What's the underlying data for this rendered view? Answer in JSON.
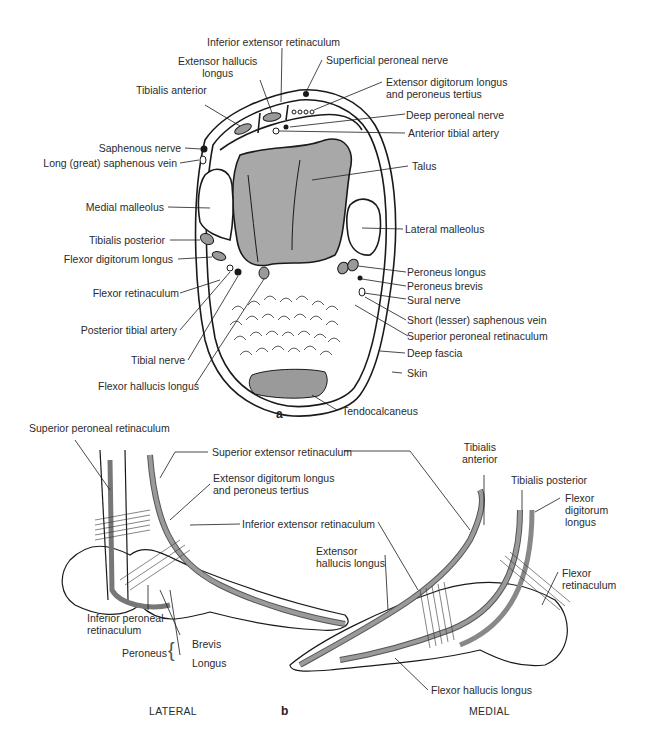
{
  "figure": {
    "panel_a_tag": "a",
    "panel_b_tag": "b",
    "colors": {
      "line": "#1a1a1a",
      "bone_fill": "#a8a8a8",
      "tendon_fill": "#9a9a9a",
      "background": "#ffffff"
    }
  },
  "panel_a": {
    "title": "Transverse section through ankle",
    "labels": {
      "inferior_extensor_retinaculum": "Inferior extensor retinaculum",
      "superficial_peroneal_nerve": "Superficial peroneal nerve",
      "extensor_hallucis_longus": "Extensor hallucis\nlongus",
      "tibialis_anterior": "Tibialis anterior",
      "extensor_digitorum_longus": "Extensor digitorum longus\nand peroneus tertius",
      "deep_peroneal_nerve": "Deep peroneal nerve",
      "anterior_tibial_artery": "Anterior tibial artery",
      "saphenous_nerve": "Saphenous nerve",
      "long_saphenous_vein": "Long (great) saphenous vein",
      "talus": "Talus",
      "medial_malleolus": "Medial malleolus",
      "lateral_malleolus": "Lateral malleolus",
      "tibialis_posterior": "Tibialis posterior",
      "flexor_digitorum_longus": "Flexor digitorum longus",
      "peroneus_longus": "Peroneus longus",
      "peroneus_brevis": "Peroneus brevis",
      "flexor_retinaculum": "Flexor retinaculum",
      "sural_nerve": "Sural nerve",
      "posterior_tibial_artery": "Posterior tibial artery",
      "short_saphenous_vein": "Short (lesser) saphenous vein",
      "superior_peroneal_retinaculum": "Superior peroneal retinaculum",
      "tibial_nerve": "Tibial nerve",
      "deep_fascia": "Deep fascia",
      "skin": "Skin",
      "flexor_hallucis_longus": "Flexor hallucis longus",
      "tendocalcaneus": "Tendocalcaneus"
    }
  },
  "panel_b": {
    "lateral": {
      "caption": "LATERAL",
      "labels": {
        "superior_peroneal_retinaculum": "Superior peroneal retinaculum",
        "superior_extensor_retinaculum": "Superior extensor retinaculum",
        "extensor_digitorum_longus": "Extensor digitorum longus\nand peroneus tertius",
        "inferior_extensor_retinaculum": "Inferior extensor retinaculum",
        "inferior_peroneal_retinaculum": "Inferior peroneal\nretinaculum",
        "peroneus": "Peroneus",
        "brevis": "Brevis",
        "longus": "Longus"
      }
    },
    "medial": {
      "caption": "MEDIAL",
      "labels": {
        "tibialis_anterior": "Tibialis\nanterior",
        "tibialis_posterior": "Tibialis posterior",
        "flexor_digitorum_longus": "Flexor\ndigitorum\nlongus",
        "extensor_hallucis_longus": "Extensor\nhallucis longus",
        "flexor_retinaculum": "Flexor\nretinaculum",
        "flexor_hallucis_longus": "Flexor hallucis longus"
      }
    }
  }
}
